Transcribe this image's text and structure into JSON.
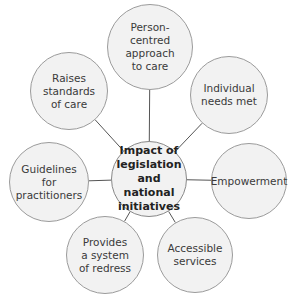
{
  "diagram": {
    "type": "mind-map",
    "center": {
      "label": "Impact of\nlegislation\nand national\ninitiatives",
      "cx": 149,
      "cy": 179,
      "r": 38
    },
    "nodes": [
      {
        "id": "person-centred",
        "label": "Person-\ncentred\napproach\nto care",
        "cx": 150,
        "cy": 47,
        "r": 43
      },
      {
        "id": "individual-needs",
        "label": "Individual\nneeds met",
        "cx": 229,
        "cy": 95,
        "r": 39
      },
      {
        "id": "empowerment",
        "label": "Empowerment",
        "cx": 249,
        "cy": 181,
        "r": 38
      },
      {
        "id": "accessible-services",
        "label": "Accessible\nservices",
        "cx": 195,
        "cy": 255,
        "r": 38
      },
      {
        "id": "system-of-redress",
        "label": "Provides\na system\nof redress",
        "cx": 105,
        "cy": 255,
        "r": 39
      },
      {
        "id": "guidelines",
        "label": "Guidelines\nfor\npractitioners",
        "cx": 49,
        "cy": 182,
        "r": 40
      },
      {
        "id": "raises-standards",
        "label": "Raises\nstandards\nof care",
        "cx": 69,
        "cy": 91,
        "r": 39
      }
    ],
    "colors": {
      "fill": "#f2f2f2",
      "stroke": "#9b9b9b",
      "connector": "#555555"
    }
  }
}
